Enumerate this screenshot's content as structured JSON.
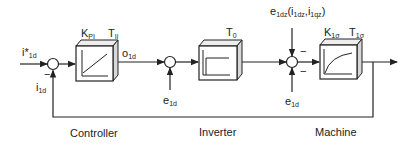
{
  "diagram": {
    "type": "control-loop-block-diagram",
    "sections": {
      "controller": "Controller",
      "inverter": "Inverter",
      "machine": "Machine"
    },
    "signals": {
      "reference": {
        "base": "i*",
        "sub": "1d"
      },
      "feedback": {
        "base": "i",
        "sub": "1d"
      },
      "controller_out": {
        "base": "o",
        "sub": "1d"
      },
      "disturbance_inverter": {
        "base": "e",
        "sub": "1d"
      },
      "disturbance_machine_top": {
        "base": "e",
        "sub": "1dz",
        "args_open": "(i",
        "args_sub1": "1dz",
        "args_comma": ",i",
        "args_sub2": "1qz",
        "args_close": ")"
      },
      "disturbance_machine_bottom": {
        "base": "e",
        "sub": "1d"
      }
    },
    "blocks": {
      "controller": {
        "gain": {
          "base": "K",
          "sub": "PI"
        },
        "time": {
          "base": "T",
          "sub": "Ii"
        },
        "shape": "ramp"
      },
      "inverter": {
        "time": {
          "base": "T",
          "sub": "0"
        },
        "shape": "step-delay"
      },
      "machine": {
        "gain": {
          "base": "K",
          "sub": "1σ"
        },
        "time": {
          "base": "T",
          "sub": "1σ"
        },
        "shape": "first-order-lag"
      }
    },
    "junction_signs": {
      "sum1_feedback": "−",
      "sum3_top": "−",
      "sum3_bottom": "−"
    },
    "colors": {
      "line": "#222222",
      "block_face": "#ffffff",
      "block_side": "#d8d8d8"
    }
  }
}
